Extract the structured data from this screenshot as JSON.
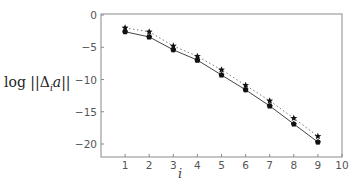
{
  "chart_data": {
    "type": "line",
    "title": "",
    "xlabel": "i",
    "ylabel": "log ||Δ_i a||",
    "xlim": [
      0,
      10
    ],
    "ylim": [
      -22,
      0
    ],
    "xticks": [
      1,
      2,
      3,
      4,
      5,
      6,
      7,
      8,
      9,
      10
    ],
    "yticks": [
      0,
      -5,
      -10,
      -15,
      -20
    ],
    "grid": false,
    "legend": null,
    "x": [
      1,
      2,
      3,
      4,
      5,
      6,
      7,
      8,
      9
    ],
    "series": [
      {
        "name": "solid-line-dots",
        "marker": "dot",
        "line_style": "solid",
        "values": [
          -2.6,
          -3.4,
          -5.4,
          -7.0,
          -9.3,
          -11.6,
          -14.1,
          -16.9,
          -19.7
        ]
      },
      {
        "name": "dotted-line-stars",
        "marker": "star",
        "line_style": "dotted",
        "values": [
          -2.0,
          -2.6,
          -4.8,
          -6.4,
          -8.5,
          -10.9,
          -13.3,
          -16.0,
          -18.8
        ]
      }
    ]
  },
  "labels": {
    "ylabel_prefix": "log ",
    "ylabel_norm_open": "||Δ",
    "ylabel_sub": "i",
    "ylabel_arg": "a",
    "ylabel_norm_close": "||",
    "xlabel": "i"
  }
}
